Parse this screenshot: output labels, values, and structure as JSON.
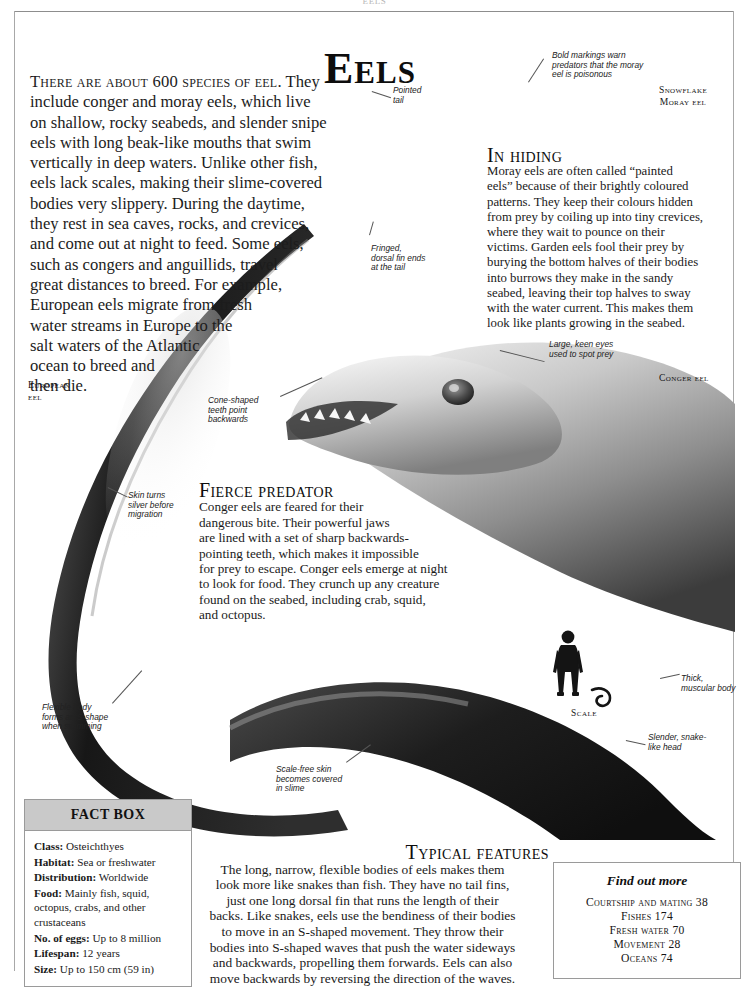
{
  "running_head": "EELS",
  "title": "Eels",
  "intro": {
    "lead": "There are about 600 species of eel.",
    "lines": [
      " They",
      "include conger and moray eels, which live",
      "on shallow, rocky seabeds, and slender snipe",
      "eels with long beak-like mouths that swim",
      "vertically in deep waters. Unlike other fish,",
      "eels lack scales, making their slime-covered",
      "bodies very slippery. During the daytime,",
      "they rest in sea caves, rocks, and crevices,",
      "and come out at night to feed. Some eels,",
      "such as congers and anguillids, travel",
      "great distances to breed. For example,",
      "European eels migrate from fresh",
      "water streams in Europe to the",
      "salt waters of the Atlantic",
      "ocean to breed and",
      "then die."
    ]
  },
  "in_hiding": {
    "heading": "In hiding",
    "lines": [
      "Moray eels are often called “painted",
      "eels” because of their brightly coloured",
      "patterns. They keep their colours hidden",
      "from prey by coiling up into tiny crevices,",
      "where they wait to pounce on their",
      "victims. Garden eels fool their prey by",
      "burying the bottom halves of their bodies",
      "into burrows they make in the sandy",
      "seabed, leaving their top halves to sway",
      "with the water current. This makes them",
      "look like plants growing in the seabed."
    ]
  },
  "fierce_predator": {
    "heading": "Fierce predator",
    "lines": [
      "Conger eels are feared for their",
      "dangerous bite. Their powerful jaws",
      "are lined with a set of sharp backwards-",
      "pointing teeth, which makes it impossible",
      "for prey to escape. Conger eels emerge at night",
      "to look for food. They crunch up any creature",
      "found on the seabed, including crab, squid,",
      "and octopus."
    ]
  },
  "typical_features": {
    "heading": "Typical features",
    "lines": [
      "The long, narrow, flexible bodies of eels makes them",
      "look more like snakes than fish. They have no tail fins,",
      "just one long dorsal fin that runs the length of their",
      "backs. Like snakes, eels use the bendiness of their bodies",
      "to move in an S-shaped movement. They throw their",
      "bodies into S-shaped waves that push the water sideways",
      "and backwards, propelling them forwards. Eels can also",
      "move backwards by reversing the direction of the waves."
    ]
  },
  "annotations": {
    "pointed_tail": [
      "Pointed",
      "tail"
    ],
    "bold_markings": [
      "Bold markings warn",
      "predators that the moray",
      "eel is poisonous"
    ],
    "fringed_dorsal": [
      "Fringed,",
      "dorsal fin ends",
      "at the tail"
    ],
    "cone_teeth": [
      "Cone-shaped",
      "teeth point",
      "backwards"
    ],
    "large_eyes": [
      "Large, keen eyes",
      "used to spot prey"
    ],
    "skin_silver": [
      "Skin turns",
      "silver before",
      "migration"
    ],
    "flexible_body": [
      "Flexible body",
      "forms an S-shape",
      "when swimming"
    ],
    "scale_free_skin": [
      "Scale-free skin",
      "becomes covered",
      "in slime"
    ],
    "thick_body": [
      "Thick,",
      "muscular body"
    ],
    "slender_head": [
      "Slender, snake-",
      "like head"
    ]
  },
  "specimen_labels": {
    "snowflake_moray": [
      "Snowflake",
      "Moray eel"
    ],
    "european_eel": [
      "European",
      "eel"
    ],
    "conger_eel": "Conger eel",
    "scale": "Scale"
  },
  "fact_box": {
    "title": "FACT BOX",
    "rows": [
      {
        "key": "Class:",
        "value": "Osteichthyes"
      },
      {
        "key": "Habitat:",
        "value": "Sea or freshwater"
      },
      {
        "key": "Distribution:",
        "value": "Worldwide"
      },
      {
        "key": "Food:",
        "value": "Mainly fish, squid, octopus, crabs, and other crustaceans"
      },
      {
        "key": "No. of eggs:",
        "value": "Up to 8 million"
      },
      {
        "key": "Lifespan:",
        "value": "12 years"
      },
      {
        "key": "Size:",
        "value": "Up to 150 cm (59 in)"
      }
    ]
  },
  "find_out_more": {
    "title": "Find out more",
    "items": [
      "Courtship and mating  38",
      "Fishes  174",
      "Fresh water  70",
      "Movement  28",
      "Oceans  74"
    ]
  },
  "colors": {
    "page_background": "#ffffff",
    "text": "#1a1a1a",
    "fact_box_header": "#c9c9c9",
    "rule": "#8d8d8d"
  }
}
